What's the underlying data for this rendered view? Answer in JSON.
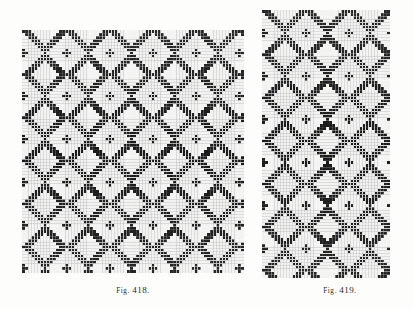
{
  "page": {
    "background_color": "#fdfdfc",
    "ink_color": "#1a1a1a",
    "grid_line_color": "#b9b9b9",
    "blank_cell_color": "#f2f2f0",
    "caption_color": "#2b2b2b"
  },
  "figures": [
    {
      "id": "fig-418",
      "caption_prefix": "Fig.",
      "caption_number": "418.",
      "caption_full": "Fig. 418.",
      "x": 22,
      "y": 30,
      "width": 222,
      "height": 243,
      "cell_size": 3.08,
      "columns": 72,
      "rows": 79,
      "weave_type": "point-twill-diamond",
      "description": "Chevron / diamond pointed twill weave draft forming large lozenge motifs",
      "threading_repeat": 24,
      "treadling_repeat": 26,
      "twill_run": 3,
      "shafts": 8
    },
    {
      "id": "fig-419",
      "caption_prefix": "Fig.",
      "caption_number": "419.",
      "caption_full": "Fig. 419.",
      "x": 262,
      "y": 10,
      "width": 128,
      "height": 268,
      "cell_size": 3.08,
      "columns": 42,
      "rows": 87,
      "weave_type": "point-twill-zigzag",
      "description": "Vertical zigzag point twill weave draft with columnar stripe structure",
      "threading_repeat": 14,
      "treadling_repeat": 16,
      "twill_run": 3,
      "shafts": 8
    }
  ]
}
